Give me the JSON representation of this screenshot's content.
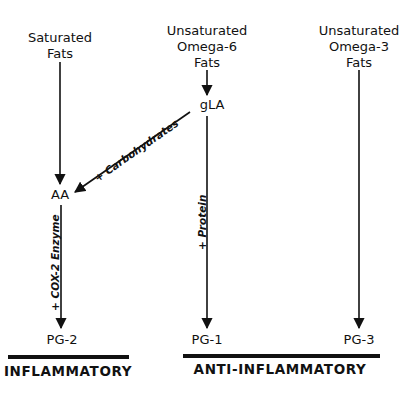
{
  "sources": {
    "saturated": {
      "line1": "Saturated",
      "line2": "Fats"
    },
    "omega6": {
      "line1": "Unsaturated",
      "line2": "Omega-6",
      "line3": "Fats"
    },
    "omega3": {
      "line1": "Unsaturated",
      "line2": "Omega-3",
      "line3": "Fats"
    }
  },
  "nodes": {
    "gla": "gLA",
    "aa": "AA",
    "pg2": "PG-2",
    "pg1": "PG-1",
    "pg3": "PG-3"
  },
  "edge_labels": {
    "carbohydrates": "+ Carbohydrates",
    "cox2": "+ COX-2 Enzyme",
    "protein": "+ Protein"
  },
  "categories": {
    "inflammatory": "INFLAMMATORY",
    "anti_inflammatory": "ANTI-INFLAMMATORY"
  },
  "colors": {
    "line": "#111111",
    "background": "#ffffff"
  }
}
